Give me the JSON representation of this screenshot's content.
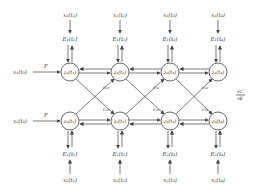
{
  "diagram": {
    "top_inputs": [
      "x₁(t₁)",
      "x₁(t₂)",
      "x₁(t₃)",
      "x₁(t₄)"
    ],
    "top_E": [
      "E₁(t₁)",
      "E₁(t₂)",
      "E₁(t₃)",
      "E₁(t₄)"
    ],
    "top_nodes": [
      "z₁(t₁)",
      "z₁(t₂)",
      "z₁(t₃)",
      "z₁(t₄)"
    ],
    "bottom_nodes": [
      "z₂(t₁)",
      "z₂(t₂)",
      "z₂(t₃)",
      "z₂(t₄)"
    ],
    "bottom_E": [
      "E₂(t₁)",
      "E₂(t₂)",
      "E₂(t₃)",
      "E₂(t₄)"
    ],
    "bottom_inputs": [
      "x₂(t₁)",
      "x₂(t₂)",
      "x₂(t₃)",
      "x₂(t₄)"
    ],
    "left_top_input": "x₁(t₀)",
    "left_bottom_input": "x₂(t₀)",
    "F_top": "F",
    "F_bottom": "F",
    "cross_labels_top": [
      "c₁₂",
      "c₁₂",
      "c₁₂"
    ],
    "cross_labels_bottom": [
      "c₂₁",
      "c₂₁",
      "c₂₁"
    ],
    "gradient_label_num": "∂C",
    "gradient_label_den": "∂K",
    "colors": {
      "stroke": "#444444",
      "text": "#333333"
    }
  }
}
